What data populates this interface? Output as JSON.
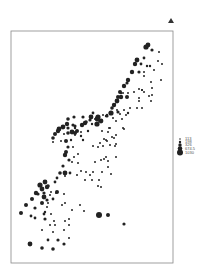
{
  "chart_data": {
    "type": "scatter",
    "title": "",
    "xlabel": "",
    "ylabel": "",
    "grid": false,
    "legend_position": "right",
    "legend": {
      "title": "",
      "entries": [
        "113",
        "198",
        "326",
        "674.5",
        "1030"
      ],
      "radii": [
        0.8,
        1.2,
        1.7,
        2.3,
        3.0
      ]
    },
    "marker_color": "#222222",
    "frame": {
      "x": 11,
      "y": 31,
      "w": 162,
      "h": 232
    },
    "points": [
      [
        146,
        47,
        2.6
      ],
      [
        148,
        45,
        2.4
      ],
      [
        152,
        50,
        1.6
      ],
      [
        159,
        52,
        1.0
      ],
      [
        144,
        58,
        1.4
      ],
      [
        137,
        60,
        2.4
      ],
      [
        135,
        64,
        2.2
      ],
      [
        141,
        64,
        1.4
      ],
      [
        147,
        66,
        1.2
      ],
      [
        150,
        66,
        1.2
      ],
      [
        158,
        61,
        1.0
      ],
      [
        162,
        64,
        1.0
      ],
      [
        154,
        70,
        1.0
      ],
      [
        144,
        72,
        1.0
      ],
      [
        139,
        72,
        1.6
      ],
      [
        132,
        72,
        2.2
      ],
      [
        144,
        76,
        1.0
      ],
      [
        161,
        80,
        1.0
      ],
      [
        128,
        80,
        2.2
      ],
      [
        127,
        83,
        1.6
      ],
      [
        151,
        82,
        1.0
      ],
      [
        124,
        86,
        2.2
      ],
      [
        139,
        89,
        1.0
      ],
      [
        142,
        90,
        1.0
      ],
      [
        152,
        88,
        1.0
      ],
      [
        120,
        92,
        2.0
      ],
      [
        134,
        92,
        1.0
      ],
      [
        144,
        92,
        1.0
      ],
      [
        121,
        93,
        1.2
      ],
      [
        149,
        96,
        1.0
      ],
      [
        142,
        90,
        1.0
      ],
      [
        118,
        97,
        2.0
      ],
      [
        123,
        93,
        1.0
      ],
      [
        128,
        93,
        1.0
      ],
      [
        139,
        98,
        1.0
      ],
      [
        152,
        95,
        1.0
      ],
      [
        121,
        97,
        2.2
      ],
      [
        127,
        97,
        2.0
      ],
      [
        115,
        104,
        1.0
      ],
      [
        151,
        101,
        1.0
      ],
      [
        139,
        101,
        1.0
      ],
      [
        117,
        101,
        2.4
      ],
      [
        114,
        105,
        2.2
      ],
      [
        112,
        108,
        1.8
      ],
      [
        137,
        108,
        1.0
      ],
      [
        130,
        108,
        1.0
      ],
      [
        124,
        110,
        1.0
      ],
      [
        118,
        112,
        1.6
      ],
      [
        111,
        113,
        2.6
      ],
      [
        103,
        115,
        1.0
      ],
      [
        107,
        116,
        1.6
      ],
      [
        142,
        108,
        1.0
      ],
      [
        95,
        119,
        1.0
      ],
      [
        99,
        121,
        1.0
      ],
      [
        106,
        116,
        1.2
      ],
      [
        101,
        121,
        2.4
      ],
      [
        90,
        120,
        1.6
      ],
      [
        117,
        110,
        1.0
      ],
      [
        83,
        117,
        1.6
      ],
      [
        74,
        117,
        1.6
      ],
      [
        68,
        119,
        1.8
      ],
      [
        85,
        123,
        2.2
      ],
      [
        92,
        124,
        1.2
      ],
      [
        97,
        119,
        2.4
      ],
      [
        86,
        122,
        1.8
      ],
      [
        107,
        115,
        1.2
      ],
      [
        98,
        117,
        2.6
      ],
      [
        93,
        113,
        1.4
      ],
      [
        110,
        113,
        1.2
      ],
      [
        113,
        118,
        1.0
      ],
      [
        120,
        114,
        1.0
      ],
      [
        128,
        113,
        1.2
      ],
      [
        73,
        125,
        1.6
      ],
      [
        67,
        124,
        2.2
      ],
      [
        68,
        128,
        1.6
      ],
      [
        75,
        126,
        1.6
      ],
      [
        82,
        125,
        2.2
      ],
      [
        91,
        117,
        2.4
      ],
      [
        97,
        124,
        2.6
      ],
      [
        109,
        128,
        1.0
      ],
      [
        116,
        121,
        1.0
      ],
      [
        122,
        119,
        1.0
      ],
      [
        126,
        115,
        1.0
      ],
      [
        63,
        127,
        2.4
      ],
      [
        59,
        129,
        2.4
      ],
      [
        75,
        128,
        1.2
      ],
      [
        81,
        132,
        1.0
      ],
      [
        88,
        131,
        1.2
      ],
      [
        102,
        131,
        1.0
      ],
      [
        108,
        132,
        1.0
      ],
      [
        110,
        128,
        1.0
      ],
      [
        123,
        128,
        1.0
      ],
      [
        58,
        131,
        2.2
      ],
      [
        55,
        134,
        2.0
      ],
      [
        64,
        134,
        1.0
      ],
      [
        75,
        135,
        1.0
      ],
      [
        81,
        136,
        1.2
      ],
      [
        104,
        139,
        1.0
      ],
      [
        106,
        140,
        1.0
      ],
      [
        107,
        141,
        1.0
      ],
      [
        112,
        137,
        1.0
      ],
      [
        116,
        135,
        1.0
      ],
      [
        53,
        138,
        1.8
      ],
      [
        53,
        142,
        1.0
      ],
      [
        61,
        141,
        1.0
      ],
      [
        71,
        140,
        1.2
      ],
      [
        83,
        140,
        1.2
      ],
      [
        100,
        143,
        1.0
      ],
      [
        114,
        138,
        1.0
      ],
      [
        116,
        144,
        1.0
      ],
      [
        124,
        129,
        1.0
      ],
      [
        68,
        133,
        1.8
      ],
      [
        72,
        132,
        2.4
      ],
      [
        75,
        133,
        2.0
      ],
      [
        77,
        131,
        2.0
      ],
      [
        66,
        141,
        2.0
      ],
      [
        68,
        147,
        1.6
      ],
      [
        73,
        147,
        1.0
      ],
      [
        93,
        146,
        1.0
      ],
      [
        98,
        147,
        1.0
      ],
      [
        103,
        146,
        1.0
      ],
      [
        110,
        145,
        1.0
      ],
      [
        115,
        146,
        1.0
      ],
      [
        116,
        157,
        1.0
      ],
      [
        66,
        152,
        2.0
      ],
      [
        74,
        157,
        1.0
      ],
      [
        78,
        154,
        1.0
      ],
      [
        65,
        155,
        2.2
      ],
      [
        69,
        160,
        1.6
      ],
      [
        63,
        166,
        1.6
      ],
      [
        72,
        162,
        1.0
      ],
      [
        78,
        163,
        1.0
      ],
      [
        95,
        162,
        1.0
      ],
      [
        101,
        160,
        1.0
      ],
      [
        104,
        159,
        1.0
      ],
      [
        106,
        157,
        1.0
      ],
      [
        108,
        161,
        1.0
      ],
      [
        60,
        173,
        1.8
      ],
      [
        57,
        178,
        1.4
      ],
      [
        55,
        182,
        1.4
      ],
      [
        65,
        173,
        2.4
      ],
      [
        65,
        176,
        1.0
      ],
      [
        70,
        173,
        1.4
      ],
      [
        81,
        171,
        1.0
      ],
      [
        77,
        175,
        1.0
      ],
      [
        86,
        172,
        1.0
      ],
      [
        93,
        172,
        1.0
      ],
      [
        102,
        172,
        1.0
      ],
      [
        108,
        167,
        1.0
      ],
      [
        85,
        180,
        1.0
      ],
      [
        90,
        175,
        1.0
      ],
      [
        92,
        180,
        1.0
      ],
      [
        98,
        186,
        1.0
      ],
      [
        99,
        180,
        1.0
      ],
      [
        101,
        187,
        1.0
      ],
      [
        111,
        174,
        1.0
      ],
      [
        45,
        182,
        2.4
      ],
      [
        40,
        185,
        2.6
      ],
      [
        42,
        189,
        2.4
      ],
      [
        47,
        187,
        2.2
      ],
      [
        44,
        193,
        1.6
      ],
      [
        48,
        186,
        1.8
      ],
      [
        38,
        194,
        1.6
      ],
      [
        36,
        193,
        2.2
      ],
      [
        50,
        195,
        1.0
      ],
      [
        51,
        192,
        1.0
      ],
      [
        57,
        192,
        2.0
      ],
      [
        44,
        197,
        2.4
      ],
      [
        47,
        200,
        1.6
      ],
      [
        42,
        203,
        2.0
      ],
      [
        47,
        207,
        1.0
      ],
      [
        45,
        212,
        1.2
      ],
      [
        56,
        193,
        1.0
      ],
      [
        64,
        194,
        1.0
      ],
      [
        53,
        199,
        1.4
      ],
      [
        48,
        203,
        1.0
      ],
      [
        62,
        205,
        1.0
      ],
      [
        65,
        203,
        1.0
      ],
      [
        72,
        210,
        1.0
      ],
      [
        80,
        205,
        1.0
      ],
      [
        84,
        211,
        1.0
      ],
      [
        32,
        199,
        2.0
      ],
      [
        26,
        205,
        2.0
      ],
      [
        35,
        208,
        1.6
      ],
      [
        21,
        213,
        2.0
      ],
      [
        44,
        214,
        1.4
      ],
      [
        51,
        214,
        1.0
      ],
      [
        31,
        216,
        1.4
      ],
      [
        35,
        218,
        1.4
      ],
      [
        45,
        219,
        1.6
      ],
      [
        54,
        221,
        1.0
      ],
      [
        65,
        221,
        1.0
      ],
      [
        69,
        219,
        1.0
      ],
      [
        99,
        215,
        3.0
      ],
      [
        108,
        215,
        2.0
      ],
      [
        124,
        224,
        1.6
      ],
      [
        50,
        225,
        1.0
      ],
      [
        55,
        225,
        1.0
      ],
      [
        69,
        225,
        1.0
      ],
      [
        42,
        230,
        1.0
      ],
      [
        53,
        232,
        1.0
      ],
      [
        64,
        230,
        1.0
      ],
      [
        69,
        238,
        1.0
      ],
      [
        30,
        244,
        2.4
      ],
      [
        48,
        240,
        1.4
      ],
      [
        58,
        240,
        1.6
      ],
      [
        64,
        244,
        1.6
      ],
      [
        42,
        248,
        1.8
      ],
      [
        53,
        249,
        1.8
      ],
      [
        64,
        244,
        1.0
      ]
    ]
  },
  "marker": {
    "label": "▲"
  }
}
